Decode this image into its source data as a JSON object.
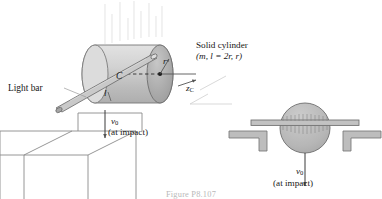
{
  "figure": {
    "caption": "Figure P8.107",
    "labels": {
      "light_bar": "Light bar",
      "solid_cylinder": "Solid cylinder",
      "cylinder_params": "(m, l = 2r, r)",
      "center": "C",
      "radius": "r",
      "length": "l",
      "axis_zc": "z",
      "axis_zc_sub": "C",
      "v0": "v",
      "v0_sub": "0",
      "at_impact": "(at impact)"
    },
    "colors": {
      "outline": "#6f6f6f",
      "cylinder_body": "#cfcfcf",
      "cylinder_end_dark": "#a9a9a9",
      "cylinder_end_light": "#d9d9d9",
      "bar_fill": "#c4c4c4",
      "support_fill": "#bdbdbd",
      "text": "#171717",
      "caption": "#b9b9b9",
      "drop_lines": "#d7d7d7",
      "table_line": "#8b8b8b"
    }
  }
}
